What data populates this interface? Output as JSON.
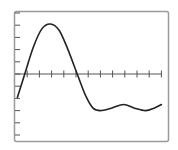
{
  "chart_data": {
    "type": "line",
    "title": "",
    "xlabel": "",
    "ylabel": "",
    "grid": false,
    "legend": null,
    "x_ticks": [
      1,
      2,
      3,
      4,
      5,
      6,
      7,
      8,
      9,
      10,
      11,
      12
    ],
    "y_ticks": [
      -5,
      -4,
      -3,
      -2,
      -1,
      0,
      1,
      2,
      3,
      4,
      5
    ],
    "xlim": [
      0,
      12.7
    ],
    "ylim": [
      -5.2,
      5.1
    ],
    "series": [
      {
        "name": "curve",
        "color": "#222222",
        "x": [
          0.2,
          0.8,
          1.5,
          2.2,
          2.9,
          3.6,
          4.3,
          5.1,
          5.8,
          6.4,
          7.0,
          7.9,
          8.9,
          9.8,
          10.7,
          11.4,
          12.0
        ],
        "y": [
          -1.9,
          0.0,
          2.2,
          3.7,
          4.1,
          3.6,
          2.1,
          0.0,
          -1.8,
          -2.8,
          -3.0,
          -2.8,
          -2.5,
          -2.8,
          -3.0,
          -2.8,
          -2.5
        ]
      }
    ]
  },
  "frame": {
    "border_color": "#9a9a9a",
    "axis_color": "#555555",
    "background": "#ffffff"
  }
}
